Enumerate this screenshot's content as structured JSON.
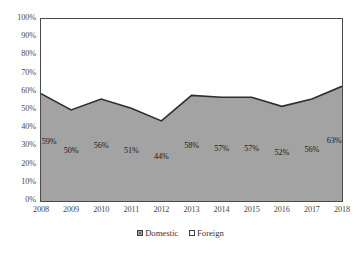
{
  "chart_data": {
    "type": "area",
    "stacked": "100%",
    "title": "",
    "subtitle": "",
    "xlabel": "",
    "ylabel": "",
    "categories": [
      "2008",
      "2009",
      "2010",
      "2011",
      "2012",
      "2013",
      "2014",
      "2015",
      "2016",
      "2017",
      "2018"
    ],
    "series": [
      {
        "name": "Domestic",
        "color": "#a3a3a3",
        "values": [
          59,
          50,
          56,
          51,
          44,
          58,
          57,
          57,
          52,
          56,
          63
        ],
        "labels": [
          "59%",
          "50%",
          "56%",
          "51%",
          "44%",
          "58%",
          "57%",
          "57%",
          "52%",
          "56%",
          "63%"
        ]
      },
      {
        "name": "Foreign",
        "color": "#ffffff",
        "values": [
          41,
          50,
          44,
          49,
          56,
          42,
          43,
          43,
          48,
          44,
          37
        ],
        "labels": []
      }
    ],
    "ylim": [
      0,
      100
    ],
    "yticks": [
      0,
      10,
      20,
      30,
      40,
      50,
      60,
      70,
      80,
      90,
      100
    ],
    "ytick_labels": [
      "0%",
      "10%",
      "20%",
      "30%",
      "40%",
      "50%",
      "60%",
      "70%",
      "80%",
      "90%",
      "100%"
    ],
    "grid": false,
    "legend_position": "bottom",
    "legend": [
      "Domestic",
      "Foreign"
    ]
  },
  "legend": {
    "items": [
      {
        "label": "Domestic",
        "marker": "filled-square-icon"
      },
      {
        "label": "Foreign",
        "marker": "empty-square-icon"
      }
    ]
  }
}
